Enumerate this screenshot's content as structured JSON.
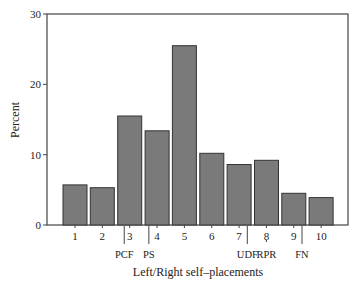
{
  "chart_data": {
    "type": "bar",
    "title": "",
    "xlabel": "Left/Right self–placements",
    "ylabel": "Percent",
    "ylim": [
      0,
      30
    ],
    "yticks": [
      0,
      10,
      20,
      30
    ],
    "grid": false,
    "legend": null,
    "categories": [
      "1",
      "2",
      "3",
      "4",
      "5",
      "6",
      "7",
      "8",
      "9",
      "10"
    ],
    "values": [
      5.7,
      5.3,
      15.5,
      13.4,
      25.5,
      10.2,
      8.6,
      9.2,
      4.5,
      3.9
    ],
    "annotations": [
      {
        "label": "PCF",
        "position": 2.8,
        "line": "solid"
      },
      {
        "label": "PS",
        "position": 3.7,
        "line": "solid"
      },
      {
        "label": "UDF",
        "position": 7.3,
        "line": "solid"
      },
      {
        "label": "RPR",
        "position": 8.0,
        "line": "dashed"
      },
      {
        "label": "FN",
        "position": 9.3,
        "line": "solid"
      }
    ],
    "colors": {
      "bar_fill": "#7a7a7a",
      "bar_edge": "#333333",
      "axis": "#444444"
    }
  }
}
